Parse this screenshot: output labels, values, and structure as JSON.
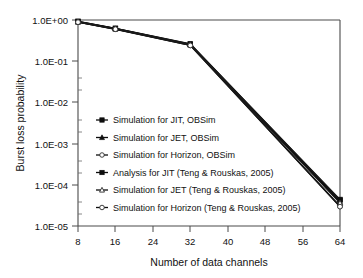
{
  "chart_data": {
    "type": "line",
    "title": "",
    "xlabel": "Number of data channels",
    "ylabel": "Burst loss probability",
    "x": [
      8,
      16,
      32,
      64
    ],
    "xticks": [
      "8",
      "16",
      "24",
      "32",
      "40",
      "48",
      "56",
      "64"
    ],
    "xtick_values": [
      8,
      16,
      24,
      32,
      40,
      48,
      56,
      64
    ],
    "xlim": [
      8,
      64
    ],
    "yticks": [
      "1.0E+00",
      "1.0E-01",
      "1.0E-02",
      "1.0E-03",
      "1.0E-04",
      "1.0E-05"
    ],
    "ytick_values": [
      1,
      0.1,
      0.01,
      0.001,
      0.0001,
      1e-05
    ],
    "ylim": [
      1e-05,
      1
    ],
    "yscale": "log",
    "grid": false,
    "legend_position": "inside-left-middle",
    "series": [
      {
        "name": "Simulation for JIT, OBSim",
        "marker": "filled-square",
        "values": [
          0.92,
          0.62,
          0.26,
          4.2e-05
        ]
      },
      {
        "name": "Simulation for JET, OBSim",
        "marker": "filled-triangle",
        "values": [
          0.9,
          0.61,
          0.25,
          3.8e-05
        ]
      },
      {
        "name": "Simulation for Horizon, OBSim",
        "marker": "open-circle",
        "values": [
          0.89,
          0.6,
          0.243,
          3e-05
        ]
      },
      {
        "name": "Analysis for JIT (Teng & Rouskas, 2005)",
        "marker": "filled-square",
        "values": [
          0.93,
          0.63,
          0.262,
          4.4e-05
        ]
      },
      {
        "name": "Simulation for JET (Teng & Rouskas, 2005)",
        "marker": "open-triangle",
        "values": [
          0.905,
          0.615,
          0.252,
          3.6e-05
        ]
      },
      {
        "name": "Simulation for Horizon (Teng & Rouskas, 2005)",
        "marker": "open-circle",
        "values": [
          0.885,
          0.598,
          0.241,
          2.95e-05
        ]
      }
    ]
  },
  "colors": {
    "line": "#0d0d0d",
    "axis": "#4a4a4a",
    "text": "#111111",
    "background": "#ffffff"
  }
}
